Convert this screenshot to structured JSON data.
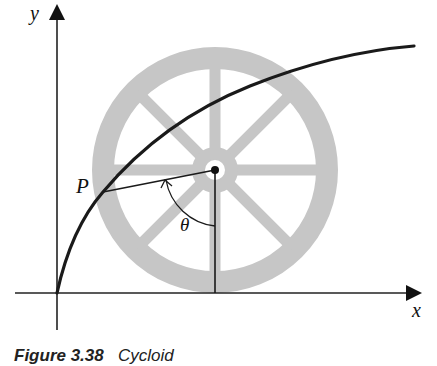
{
  "figure": {
    "caption_label": "Figure 3.38",
    "caption_title": "Cycloid",
    "axes": {
      "x_label": "x",
      "y_label": "y"
    },
    "point_label": "P",
    "angle_label": "θ",
    "wheel": {
      "spokes": 8,
      "fill_color": "#c4c4c4"
    },
    "curve_color": "#1a1a1a"
  }
}
